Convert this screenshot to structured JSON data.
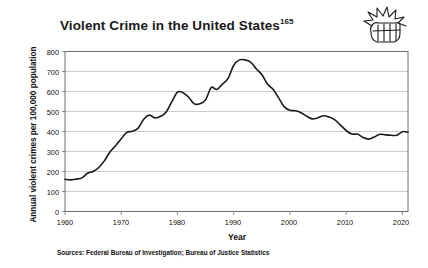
{
  "title": {
    "main": "Violent Crime in the United States",
    "footnote_marker": "165"
  },
  "icon": {
    "name": "fist-icon",
    "label": "fist-punch-icon"
  },
  "axes": {
    "y_title": "Annual violent crimes per 100,000 population",
    "x_title": "Year",
    "y_ticks": [
      "800",
      "700",
      "600",
      "500",
      "400",
      "300",
      "200",
      "100",
      "0"
    ],
    "x_ticks": [
      "1960",
      "1970",
      "1980",
      "1990",
      "2000",
      "2010",
      "2020"
    ]
  },
  "source_note": "Sources: Federal Bureau of Investigation; Bureau of Justice Statistics",
  "colors": {
    "line": "#1a1a1a",
    "grid": "#b8b8b8",
    "frame": "#6e6e6e",
    "background": "#ffffff",
    "text": "#111111"
  },
  "chart_data": {
    "type": "line",
    "title": "Violent Crime in the United States",
    "xlabel": "Year",
    "ylabel": "Annual violent crimes per 100,000 population",
    "xlim": [
      1960,
      2021
    ],
    "ylim": [
      0,
      800
    ],
    "grid": true,
    "legend": "none",
    "x_tick_values": [
      1960,
      1970,
      1980,
      1990,
      2000,
      2010,
      2020
    ],
    "y_tick_values": [
      0,
      100,
      200,
      300,
      400,
      500,
      600,
      700,
      800
    ],
    "annotations": [
      "Peak of about 758 per 100,000 in 1991",
      "Local peak of about 597 in 1980",
      "Starts near 161 in 1960",
      "Ends near 396 in 2021"
    ],
    "series": [
      {
        "name": "Violent crime rate per 100,000 population",
        "x": [
          1960,
          1961,
          1962,
          1963,
          1964,
          1965,
          1966,
          1967,
          1968,
          1969,
          1970,
          1971,
          1972,
          1973,
          1974,
          1975,
          1976,
          1977,
          1978,
          1979,
          1980,
          1981,
          1982,
          1983,
          1984,
          1985,
          1986,
          1987,
          1988,
          1989,
          1990,
          1991,
          1992,
          1993,
          1994,
          1995,
          1996,
          1997,
          1998,
          1999,
          2000,
          2001,
          2002,
          2003,
          2004,
          2005,
          2006,
          2007,
          2008,
          2009,
          2010,
          2011,
          2012,
          2013,
          2014,
          2015,
          2016,
          2017,
          2018,
          2019,
          2020,
          2021
        ],
        "values": [
          161,
          158,
          162,
          168,
          191,
          200,
          220,
          253,
          298,
          329,
          364,
          396,
          401,
          417,
          461,
          482,
          468,
          476,
          498,
          549,
          597,
          594,
          571,
          538,
          539,
          558,
          620,
          610,
          637,
          666,
          730,
          758,
          758,
          747,
          714,
          685,
          637,
          611,
          568,
          523,
          506,
          504,
          494,
          476,
          463,
          469,
          479,
          472,
          458,
          432,
          405,
          387,
          387,
          370,
          362,
          373,
          386,
          383,
          381,
          381,
          399,
          396
        ]
      }
    ]
  }
}
